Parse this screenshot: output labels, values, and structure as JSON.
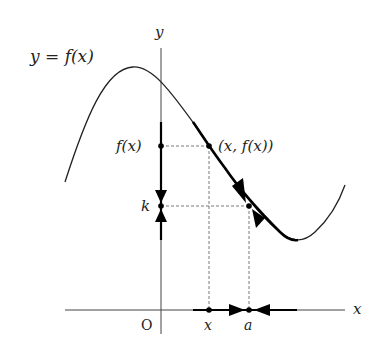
{
  "diagram": {
    "curve_label": "y = f(x)",
    "y_axis_label": "y",
    "x_axis_label": "x",
    "origin_label": "O",
    "point_label": "(x, f(x))",
    "fx_label": "f(x)",
    "k_label": "k",
    "x_tick_label": "x",
    "a_tick_label": "a"
  }
}
